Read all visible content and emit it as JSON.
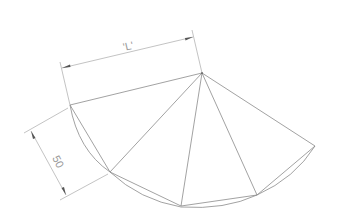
{
  "diagram": {
    "type": "cone-development-sheet",
    "labels": {
      "length_dimension": "'L'",
      "segment_dimension": "50"
    },
    "colors": {
      "background": "#ffffff",
      "line": "#8a8a8a",
      "dimension": "#9a9a9a"
    }
  }
}
